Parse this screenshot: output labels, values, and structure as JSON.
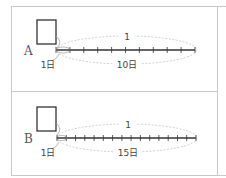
{
  "colors": {
    "border": "#c8c8c8",
    "line": "#333333",
    "dashed": "#bbbbbb",
    "text": "#444444"
  },
  "panels": [
    {
      "letter": "A",
      "top_label": "1",
      "bottom_label": "10日",
      "unit_label": "1日",
      "segments": 10
    },
    {
      "letter": "B",
      "top_label": "1",
      "bottom_label": "15日",
      "unit_label": "1日",
      "segments": 15
    }
  ]
}
